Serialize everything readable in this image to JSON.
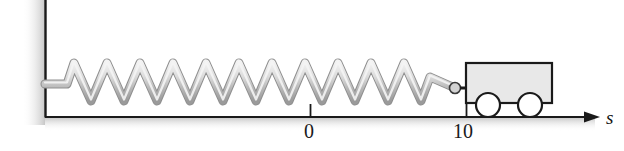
{
  "figure": {
    "kind": "physics-diagram",
    "caption_text": "",
    "axis": {
      "label": "s",
      "label_x": 606,
      "label_y": 108,
      "line_y": 117,
      "line_x_start": 45,
      "line_x_end": 590,
      "arrow_tip_x": 597,
      "direction": "right"
    },
    "ticks": [
      {
        "label": "0",
        "x": 310,
        "label_x": 304,
        "label_y": 121
      },
      {
        "label": "10",
        "x": 466,
        "label_x": 454,
        "label_y": 121
      }
    ],
    "wall": {
      "name": "fixed-support-wall",
      "x": 45,
      "y_top": 0,
      "y_bottom": 117
    },
    "spring": {
      "name": "coil-spring",
      "attach_x": 45,
      "attach_y": 84,
      "start_x": 67,
      "end_x": 430,
      "peak_y": 63,
      "valley_y": 101,
      "coil_count": 11,
      "fill_color": "#d9d9d9",
      "edge_color": "#8a8a8a"
    },
    "connector": {
      "name": "spring-hook-ball",
      "ball_x": 455,
      "ball_y": 88,
      "ball_r": 5,
      "stub_x_end": 466
    },
    "cart": {
      "name": "cart",
      "body_x": 466,
      "body_y": 63,
      "body_w": 86,
      "body_h": 40,
      "body_fill": "#e8e8e8",
      "body_stroke": "#1a1a1a",
      "wheels": [
        {
          "cx": 488,
          "cy": 105,
          "r": 12
        },
        {
          "cx": 530,
          "cy": 105,
          "r": 12
        }
      ],
      "wheel_fill": "#ffffff",
      "wheel_stroke": "#1a1a1a"
    },
    "colors": {
      "ink": "#1a1a1a",
      "spring_light": "#ededed",
      "spring_mid": "#c8c8c8",
      "spring_dark": "#9a9a9a",
      "shadow": "#cfcfcf",
      "background": "#ffffff"
    }
  }
}
